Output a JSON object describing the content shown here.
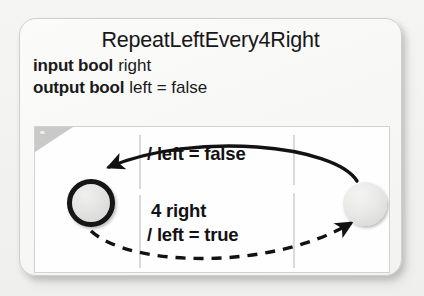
{
  "diagram": {
    "title": "RepeatLeftEvery4Right",
    "declarations": [
      {
        "keyword": "input bool",
        "identifier": "right"
      },
      {
        "keyword": "output bool",
        "identifier": "left = false"
      }
    ],
    "states": [
      {
        "name": "left-state",
        "initial": true,
        "label": ""
      },
      {
        "name": "right-state",
        "initial": false,
        "label": ""
      }
    ],
    "transitions": [
      {
        "from": "right-state",
        "to": "left-state",
        "style": "solid",
        "guard": "",
        "action": "/ left = false",
        "label": "/ left = false"
      },
      {
        "from": "left-state",
        "to": "right-state",
        "style": "dashed",
        "guard": "4 right",
        "action": "/ left = true",
        "label_line1": "4 right",
        "label_line2": "/ left = true"
      }
    ],
    "colors": {
      "state_fill": "#e3e3e1",
      "state_border": "#141414",
      "arrow": "#141414",
      "panel_bg": "#fefefe",
      "card_bg": "#f8f8f6",
      "notch": "#c9c9c7",
      "guide_line": "#c6c6c4",
      "text": "#17171a"
    }
  }
}
